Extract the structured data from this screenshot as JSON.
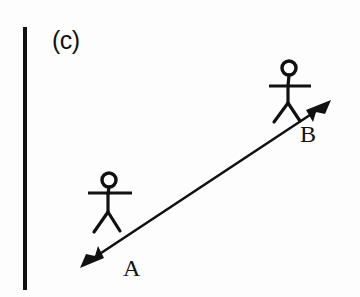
{
  "figure": {
    "panel_label": "(c)",
    "background_color": "#fdfdfd",
    "ink_color": "#111111",
    "width": 360,
    "height": 297
  },
  "reference_line": {
    "name": "vertical-reference-line",
    "x": 25,
    "y_top": 27,
    "y_bottom": 290,
    "stroke_width": 4
  },
  "arrow": {
    "label_start": "A",
    "label_end": "B",
    "start_point": {
      "x": 88,
      "y": 262
    },
    "end_point": {
      "x": 325,
      "y": 105
    },
    "double_headed": true,
    "stroke_width": 2.6
  },
  "labels": {
    "a": {
      "text": "A",
      "x": 133,
      "y": 270
    },
    "b": {
      "text": "B",
      "x": 308,
      "y": 135
    }
  },
  "figures": [
    {
      "name": "stick-figure-at-a",
      "head_center": {
        "x": 109,
        "y": 180
      },
      "head_radius": 7,
      "neck_y": 187,
      "arm_y": 193,
      "arm_left_x": 88,
      "arm_right_x": 132,
      "hip": {
        "x": 108,
        "y": 212
      },
      "foot_left": {
        "x": 94,
        "y": 232
      },
      "foot_right": {
        "x": 120,
        "y": 231
      }
    },
    {
      "name": "stick-figure-at-b",
      "head_center": {
        "x": 289,
        "y": 68
      },
      "head_radius": 7,
      "neck_y": 75,
      "arm_y": 86,
      "arm_left_x": 269,
      "arm_right_x": 311,
      "hip": {
        "x": 288,
        "y": 103
      },
      "foot_left": {
        "x": 274,
        "y": 122
      },
      "foot_right": {
        "x": 300,
        "y": 121
      }
    }
  ]
}
